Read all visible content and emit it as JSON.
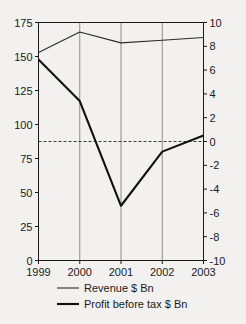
{
  "chart_data": {
    "type": "line",
    "title": "",
    "xlabel": "",
    "ylabel": "",
    "grid": "vertical-only",
    "legend_position": "bottom",
    "categories": [
      "1999",
      "2000",
      "2001",
      "2002",
      "2003"
    ],
    "x_tick_labels": [
      "1999",
      "2000",
      "2001",
      "2002",
      "2003"
    ],
    "left_axis": {
      "label": "",
      "ylim": [
        0,
        175
      ],
      "tick_step": 25,
      "tick_labels": [
        "0",
        "25",
        "50",
        "75",
        "100",
        "125",
        "150",
        "175"
      ],
      "tick_values": [
        0,
        25,
        50,
        75,
        100,
        125,
        150,
        175
      ]
    },
    "right_axis": {
      "label": "",
      "ylim": [
        -10,
        10
      ],
      "tick_step": 2,
      "tick_labels": [
        "-10",
        "-8",
        "-6",
        "-4",
        "-2",
        "0",
        "2",
        "4",
        "6",
        "8",
        "10"
      ],
      "tick_values": [
        -10,
        -8,
        -6,
        -4,
        -2,
        0,
        2,
        4,
        6,
        8,
        10
      ]
    },
    "reference_line": {
      "name": "zero-line",
      "axis": "right",
      "value": 0,
      "style": "dashed"
    },
    "series": [
      {
        "name": "Revenue $ Bn",
        "axis": "left",
        "style": "thin",
        "values": [
          153,
          168,
          160,
          162,
          164
        ]
      },
      {
        "name": "Profit before tax $ Bn",
        "axis": "right",
        "style": "thick",
        "values": [
          6.9,
          3.4,
          -5.4,
          -0.85,
          0.5
        ]
      }
    ]
  },
  "legend": {
    "items": [
      {
        "label": "Revenue $ Bn"
      },
      {
        "label": "Profit before tax $ Bn"
      }
    ]
  },
  "colors": {
    "background": "#f2f1ef",
    "axis": "#1a1a1a",
    "grid": "#8c8c8c",
    "revenue_line": "#2b2b2b",
    "profit_line": "#111111",
    "zero_line": "#3a3a3a"
  }
}
